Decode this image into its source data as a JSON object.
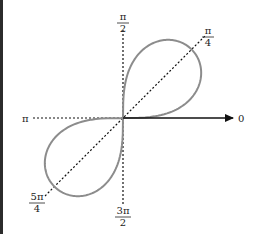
{
  "diagram": {
    "type": "polar-lemniscate",
    "equation_hint": "r^2 = a^2 sin(2θ)",
    "curve_color": "#8c8c8c",
    "axis_color": "#111111",
    "origin": [
      123,
      118
    ],
    "lobe_scale": 97,
    "labels": {
      "zero": "0",
      "pi": "π",
      "pi_over_2": {
        "num": "π",
        "den": "2"
      },
      "pi_over_4": {
        "num": "π",
        "den": "4"
      },
      "five_pi_over_4": {
        "num": "5π",
        "den": "4"
      },
      "three_pi_over_2": {
        "num": "3π",
        "den": "2"
      }
    }
  }
}
